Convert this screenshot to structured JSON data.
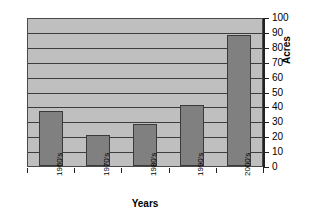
{
  "chart_data": {
    "type": "bar",
    "title": "",
    "categories": [
      "1960's",
      "1970's",
      "1980's",
      "1990's",
      "2000's"
    ],
    "values": [
      37,
      21,
      28,
      41,
      88
    ],
    "series": [
      {
        "name": "Acres",
        "values": [
          37,
          21,
          28,
          41,
          88
        ]
      }
    ],
    "xlabel": "Years",
    "ylabel": "Acres",
    "ylim": [
      0,
      100
    ],
    "ytick_step": 10,
    "yticks": [
      0,
      10,
      20,
      30,
      40,
      50,
      60,
      70,
      80,
      90,
      100
    ],
    "ytick_labels": [
      "0",
      "10",
      "20",
      "30",
      "40",
      "50",
      "60",
      "70",
      "80",
      "90",
      "100"
    ],
    "y_axis_position": "right",
    "grid": true,
    "grid_axis": "y",
    "legend": false,
    "legend_position": "none",
    "xtick_label_rotation": -90,
    "ylabel_rotation": -90,
    "colors": {
      "bar_fill": "#808080",
      "bar_border": "#3a3a3a",
      "plot_background": "#bfbfbf",
      "gridline": "#3d3d3d",
      "axis": "#222222",
      "text": "#000000",
      "figure_background": "#ffffff"
    }
  }
}
